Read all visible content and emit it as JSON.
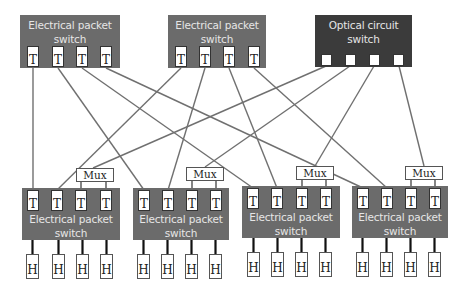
{
  "colors": {
    "eps_fill": "#6b6b6b",
    "ocs_fill": "#3b3b3b",
    "label_text": "#e6e6e6",
    "wire": "#707070",
    "host_link": "#111111"
  },
  "top_switches": [
    {
      "id": "ts1",
      "type": "electrical",
      "line1": "Electrical packet",
      "line2": "switch",
      "x": 20,
      "y": 15,
      "w": 100,
      "h": 53,
      "ports": [
        {
          "label": "T",
          "x": 27
        },
        {
          "label": "T",
          "x": 52
        },
        {
          "label": "T",
          "x": 76
        },
        {
          "label": "T",
          "x": 100
        }
      ]
    },
    {
      "id": "ts2",
      "type": "electrical",
      "line1": "Electrical packet",
      "line2": "switch",
      "x": 168,
      "y": 15,
      "w": 98,
      "h": 53,
      "ports": [
        {
          "label": "T",
          "x": 175
        },
        {
          "label": "T",
          "x": 199
        },
        {
          "label": "T",
          "x": 223
        },
        {
          "label": "T",
          "x": 248
        }
      ]
    },
    {
      "id": "ocs",
      "type": "optical",
      "line1": "Optical circuit",
      "line2": "switch",
      "x": 315,
      "y": 15,
      "w": 97,
      "h": 52,
      "ports": [
        {
          "label": "",
          "x": 321
        },
        {
          "label": "",
          "x": 345
        },
        {
          "label": "",
          "x": 369
        },
        {
          "label": "",
          "x": 393
        }
      ]
    }
  ],
  "bottom_switches": [
    {
      "id": "bs1",
      "line1": "Electrical packet",
      "line2": "switch",
      "x": 22,
      "y": 188,
      "w": 98,
      "h": 52,
      "mux": {
        "label": "Mux",
        "x": 76,
        "y": 168
      },
      "ports": [
        {
          "label": "T",
          "x": 27
        },
        {
          "label": "T",
          "x": 51
        },
        {
          "label": "T",
          "x": 75
        },
        {
          "label": "T",
          "x": 100
        }
      ],
      "hosts": [
        {
          "label": "H",
          "x": 26
        },
        {
          "label": "H",
          "x": 52
        },
        {
          "label": "H",
          "x": 76
        },
        {
          "label": "H",
          "x": 100
        }
      ]
    },
    {
      "id": "bs2",
      "line1": "Electrical packet",
      "line2": "switch",
      "x": 133,
      "y": 188,
      "w": 96,
      "h": 52,
      "mux": {
        "label": "Mux",
        "x": 186,
        "y": 167
      },
      "ports": [
        {
          "label": "T",
          "x": 138
        },
        {
          "label": "T",
          "x": 162
        },
        {
          "label": "T",
          "x": 186
        },
        {
          "label": "T",
          "x": 210
        }
      ],
      "hosts": [
        {
          "label": "H",
          "x": 137
        },
        {
          "label": "H",
          "x": 161
        },
        {
          "label": "H",
          "x": 185
        },
        {
          "label": "H",
          "x": 209
        }
      ]
    },
    {
      "id": "bs3",
      "line1": "Electrical packet",
      "line2": "switch",
      "x": 242,
      "y": 186,
      "w": 98,
      "h": 52,
      "mux": {
        "label": "Mux",
        "x": 296,
        "y": 166
      },
      "ports": [
        {
          "label": "T",
          "x": 247
        },
        {
          "label": "T",
          "x": 271
        },
        {
          "label": "T",
          "x": 296
        },
        {
          "label": "T",
          "x": 320
        }
      ],
      "hosts": [
        {
          "label": "H",
          "x": 247
        },
        {
          "label": "H",
          "x": 271
        },
        {
          "label": "H",
          "x": 295
        },
        {
          "label": "H",
          "x": 319
        }
      ]
    },
    {
      "id": "bs4",
      "line1": "Electrical packet",
      "line2": "switch",
      "x": 352,
      "y": 186,
      "w": 96,
      "h": 52,
      "mux": {
        "label": "Mux",
        "x": 405,
        "y": 166
      },
      "ports": [
        {
          "label": "T",
          "x": 357
        },
        {
          "label": "T",
          "x": 381
        },
        {
          "label": "T",
          "x": 405
        },
        {
          "label": "T",
          "x": 429
        }
      ],
      "hosts": [
        {
          "label": "H",
          "x": 356
        },
        {
          "label": "H",
          "x": 380
        },
        {
          "label": "H",
          "x": 404
        },
        {
          "label": "H",
          "x": 428
        }
      ]
    }
  ],
  "links": [
    {
      "from": "ts1.T1",
      "to": "bs1.T1",
      "x1": 33,
      "y1": 68,
      "x2": 33,
      "y2": 190
    },
    {
      "from": "ts1.T2",
      "to": "bs2.T1",
      "x1": 58,
      "y1": 68,
      "x2": 144,
      "y2": 190
    },
    {
      "from": "ts1.T3",
      "to": "bs3.T1",
      "x1": 82,
      "y1": 68,
      "x2": 253,
      "y2": 188
    },
    {
      "from": "ts1.T4",
      "to": "bs4.T1",
      "x1": 106,
      "y1": 68,
      "x2": 363,
      "y2": 188
    },
    {
      "from": "ts2.T1",
      "to": "bs1.T2",
      "x1": 181,
      "y1": 68,
      "x2": 57,
      "y2": 190
    },
    {
      "from": "ts2.T2",
      "to": "bs2.T2",
      "x1": 205,
      "y1": 68,
      "x2": 168,
      "y2": 190
    },
    {
      "from": "ts2.T3",
      "to": "bs3.T2",
      "x1": 229,
      "y1": 68,
      "x2": 277,
      "y2": 188
    },
    {
      "from": "ts2.T4",
      "to": "bs4.T2",
      "x1": 254,
      "y1": 68,
      "x2": 387,
      "y2": 188
    },
    {
      "from": "ocs.P1",
      "to": "bs1.mux",
      "x1": 326,
      "y1": 66,
      "x2": 93,
      "y2": 168
    },
    {
      "from": "ocs.P2",
      "to": "bs2.mux",
      "x1": 350,
      "y1": 66,
      "x2": 205,
      "y2": 167
    },
    {
      "from": "ocs.P3",
      "to": "bs3.mux",
      "x1": 374,
      "y1": 66,
      "x2": 315,
      "y2": 166
    },
    {
      "from": "ocs.P4",
      "to": "bs4.mux",
      "x1": 399,
      "y1": 66,
      "x2": 424,
      "y2": 166
    }
  ]
}
